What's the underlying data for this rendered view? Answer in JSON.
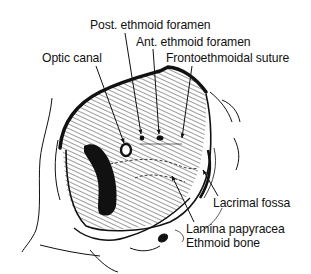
{
  "figure": {
    "labels": {
      "post_ethmoid_foramen": "Post. ethmoid foramen",
      "ant_ethmoid_foramen": "Ant. ethmoid foramen",
      "optic_canal": "Optic canal",
      "frontoethmoidal_suture": "Frontoethmoidal suture",
      "lacrimal_fossa": "Lacrimal fossa",
      "lamina_papyracea": "Lamina papyracea",
      "ethmoid_bone": "Ethmoid bone"
    },
    "colors": {
      "ink": "#111111",
      "background": "#ffffff"
    }
  }
}
